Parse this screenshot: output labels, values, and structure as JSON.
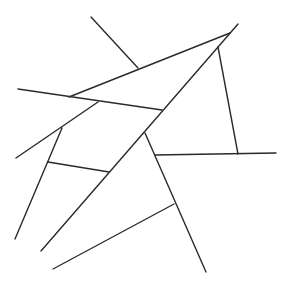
{
  "diagram": {
    "title": "",
    "width": 285,
    "height": 287,
    "background": "#ffffff",
    "stroke_color": "#2a2a2a",
    "stroke_width": 1.4,
    "segments": [
      {
        "id": "top-stub",
        "x1": 91,
        "y1": 17,
        "x2": 138,
        "y2": 68
      },
      {
        "id": "upper-edge",
        "x1": 69,
        "y1": 97,
        "x2": 230,
        "y2": 33
      },
      {
        "id": "main-diagonal",
        "x1": 41,
        "y1": 251,
        "x2": 238,
        "y2": 24
      },
      {
        "id": "cross-line",
        "x1": 18,
        "y1": 89,
        "x2": 162,
        "y2": 110
      },
      {
        "id": "left-slope",
        "x1": 16,
        "y1": 158,
        "x2": 98,
        "y2": 102
      },
      {
        "id": "left-descender",
        "x1": 62,
        "y1": 128,
        "x2": 15,
        "y2": 239
      },
      {
        "id": "crossbar",
        "x1": 48,
        "y1": 162,
        "x2": 109,
        "y2": 172
      },
      {
        "id": "right-vertical",
        "x1": 218,
        "y1": 47,
        "x2": 238,
        "y2": 154
      },
      {
        "id": "horizontal-right",
        "x1": 155,
        "y1": 155,
        "x2": 276,
        "y2": 153
      },
      {
        "id": "lower-branch",
        "x1": 145,
        "y1": 133,
        "x2": 206,
        "y2": 272
      },
      {
        "id": "bottom-slope",
        "x1": 53,
        "y1": 269,
        "x2": 174,
        "y2": 204
      }
    ]
  }
}
